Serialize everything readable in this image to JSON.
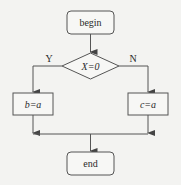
{
  "diagram": {
    "type": "flowchart",
    "colors": {
      "stroke": "#555555",
      "text": "#2a2a2a",
      "background": "#f3f3f1"
    },
    "nodes": [
      {
        "id": "begin",
        "shape": "rounded-rect",
        "label": "begin"
      },
      {
        "id": "decision",
        "shape": "diamond",
        "label": "X=0"
      },
      {
        "id": "assign_b",
        "shape": "rect",
        "label": "b=a"
      },
      {
        "id": "assign_c",
        "shape": "rect",
        "label": "c=a"
      },
      {
        "id": "end",
        "shape": "rounded-rect",
        "label": "end"
      }
    ],
    "edges": [
      {
        "from": "begin",
        "to": "decision",
        "label": ""
      },
      {
        "from": "decision",
        "to": "assign_b",
        "label": "Y"
      },
      {
        "from": "decision",
        "to": "assign_c",
        "label": "N"
      },
      {
        "from": "assign_b",
        "to": "end",
        "label": ""
      },
      {
        "from": "assign_c",
        "to": "end",
        "label": ""
      }
    ],
    "labels": {
      "begin": "begin",
      "decision": "X=0",
      "yes": "Y",
      "no": "N",
      "assign_b": "b=a",
      "assign_c": "c=a",
      "end": "end"
    }
  }
}
